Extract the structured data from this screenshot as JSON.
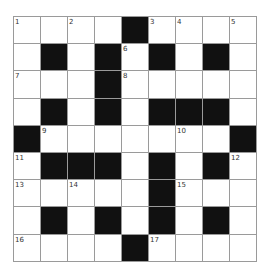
{
  "puzzle": {
    "rows": 9,
    "cols": 9,
    "colors": {
      "black": "#111111",
      "white": "#ffffff",
      "line": "#9a9a9a"
    },
    "grid": [
      [
        "1",
        ".",
        "2",
        ".",
        "#",
        "3",
        "4",
        ".",
        "5"
      ],
      [
        ".",
        "#",
        ".",
        "#",
        "6",
        "#",
        ".",
        "#",
        "."
      ],
      [
        "7",
        ".",
        ".",
        "#",
        "8",
        ".",
        ".",
        ".",
        "."
      ],
      [
        ".",
        "#",
        ".",
        "#",
        ".",
        "#",
        "#",
        "#",
        "."
      ],
      [
        "#",
        "9",
        ".",
        ".",
        ".",
        ".",
        "10",
        ".",
        "#"
      ],
      [
        "11",
        "#",
        "#",
        "#",
        ".",
        "#",
        ".",
        "#",
        "12"
      ],
      [
        "13",
        ".",
        "14",
        ".",
        ".",
        "#",
        "15",
        ".",
        "."
      ],
      [
        ".",
        "#",
        ".",
        "#",
        ".",
        "#",
        ".",
        "#",
        "."
      ],
      [
        "16",
        ".",
        ".",
        ".",
        "#",
        "17",
        ".",
        ".",
        "."
      ]
    ]
  }
}
